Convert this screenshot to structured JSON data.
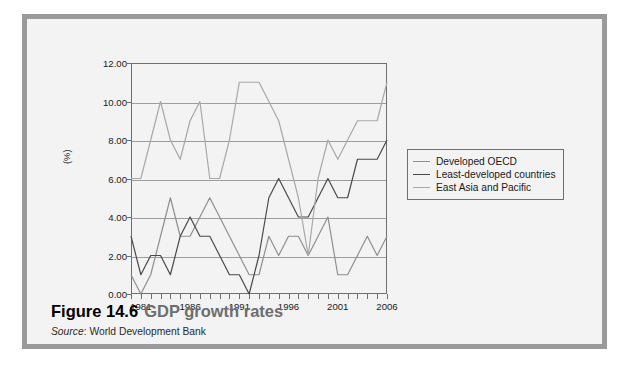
{
  "figure": {
    "number": "Figure 14.6",
    "title": "GDP growth rates",
    "source_label": "Source",
    "source_separator": ":",
    "source_text": "World Development Bank"
  },
  "colors": {
    "panel_border": "#9a9a9a",
    "panel_background": "#f3f3f3",
    "axis": "#6f6f6f",
    "gridline": "#9d9d9d",
    "developed_oecd": "#8f8f8f",
    "least_developed": "#4a4a4a",
    "east_asia": "#a8a8a8",
    "caption_number": "#000000",
    "caption_title": "#6e6e6e"
  },
  "chart_data": {
    "type": "line",
    "title": "GDP growth rates",
    "xlabel": "",
    "ylabel": "(%)",
    "ylim": [
      0,
      12
    ],
    "ytick_values": [
      0,
      2,
      4,
      6,
      8,
      10,
      12
    ],
    "ytick_labels": [
      "0.00",
      "2.00",
      "4.00",
      "6.00",
      "8.00",
      "10.00",
      "12.00"
    ],
    "grid": true,
    "grid_axis": "y",
    "legend_position": "right",
    "xlim": [
      1980,
      2006
    ],
    "x": [
      1980,
      1981,
      1982,
      1983,
      1984,
      1985,
      1986,
      1987,
      1988,
      1989,
      1990,
      1991,
      1992,
      1993,
      1994,
      1995,
      1996,
      1997,
      1998,
      1999,
      2000,
      2001,
      2002,
      2003,
      2004,
      2005,
      2006
    ],
    "xtick_values": [
      1980,
      1981,
      1982,
      1983,
      1984,
      1985,
      1986,
      1987,
      1988,
      1989,
      1990,
      1991,
      1992,
      1993,
      1994,
      1995,
      1996,
      1997,
      1998,
      1999,
      2000,
      2001,
      2002,
      2003,
      2004,
      2005,
      2006
    ],
    "xtick_labels_shown": [
      {
        "value": 1981,
        "label": "1981"
      },
      {
        "value": 1986,
        "label": "1986"
      },
      {
        "value": 1991,
        "label": "1991"
      },
      {
        "value": 1996,
        "label": "1996"
      },
      {
        "value": 2001,
        "label": "2001"
      },
      {
        "value": 2006,
        "label": "2006"
      }
    ],
    "series": [
      {
        "name": "Developed OECD",
        "color": "#8f8f8f",
        "values": [
          1.0,
          0.0,
          1.0,
          3.0,
          5.0,
          3.0,
          3.0,
          4.0,
          5.0,
          4.0,
          3.0,
          2.0,
          1.0,
          1.0,
          3.0,
          2.0,
          3.0,
          3.0,
          2.0,
          3.0,
          4.0,
          1.0,
          1.0,
          2.0,
          3.0,
          2.0,
          3.0
        ]
      },
      {
        "name": "Least-developed countries",
        "color": "#4a4a4a",
        "values": [
          3.0,
          1.0,
          2.0,
          2.0,
          1.0,
          3.0,
          4.0,
          3.0,
          3.0,
          2.0,
          1.0,
          1.0,
          0.0,
          2.0,
          5.0,
          6.0,
          5.0,
          4.0,
          4.0,
          5.0,
          6.0,
          5.0,
          5.0,
          7.0,
          7.0,
          7.0,
          8.0
        ]
      },
      {
        "name": "East Asia and Pacific",
        "color": "#a8a8a8",
        "values": [
          6.0,
          6.0,
          8.0,
          10.0,
          8.0,
          7.0,
          9.0,
          10.0,
          6.0,
          6.0,
          8.0,
          11.0,
          11.0,
          11.0,
          10.0,
          9.0,
          7.0,
          5.0,
          2.0,
          6.0,
          8.0,
          7.0,
          8.0,
          9.0,
          9.0,
          9.0,
          11.0
        ]
      }
    ]
  },
  "legend": {
    "entries": [
      {
        "label": "Developed OECD",
        "color": "#8f8f8f"
      },
      {
        "label": "Least-developed countries",
        "color": "#4a4a4a"
      },
      {
        "label": "East Asia and Pacific",
        "color": "#a8a8a8"
      }
    ]
  }
}
